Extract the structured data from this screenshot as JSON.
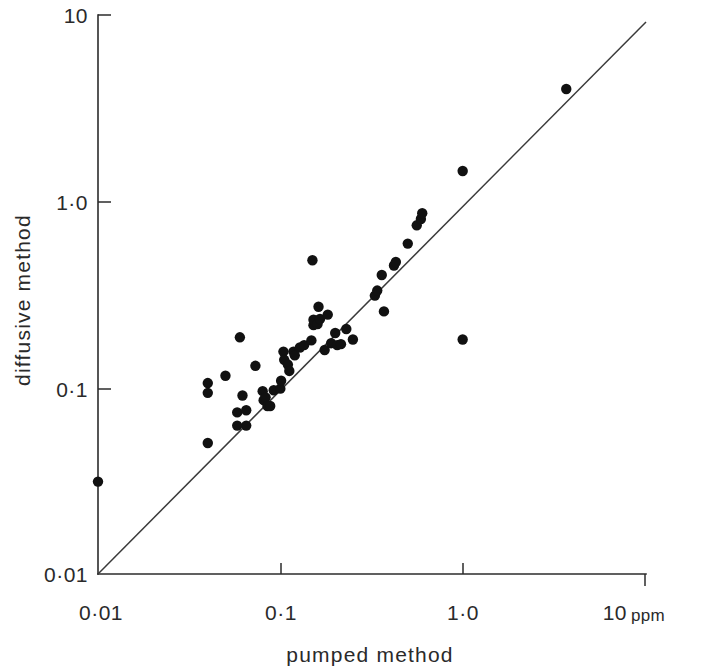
{
  "chart_data": {
    "type": "scatter",
    "title": "",
    "subtitle": "",
    "xlabel": "pumped method",
    "ylabel": "diffusive method",
    "unit_label": "ppm",
    "xscale": "log",
    "yscale": "log",
    "xlim": [
      0.01,
      10
    ],
    "ylim": [
      0.01,
      10
    ],
    "grid": false,
    "legend": null,
    "x_tick_labels": [
      "0·01",
      "0·1",
      "1·0",
      "10"
    ],
    "x_tick_values": [
      0.01,
      0.1,
      1,
      10
    ],
    "y_tick_labels": [
      "0·01",
      "0·1",
      "1·0",
      "10"
    ],
    "y_tick_values": [
      0.01,
      0.1,
      1,
      10
    ],
    "reference_line": {
      "name": "identity-line",
      "description": "1:1 line",
      "from": [
        0.01,
        0.01
      ],
      "to": [
        10,
        10
      ]
    },
    "series": [
      {
        "name": "paired measurements",
        "marker": "filled-circle",
        "color": "#111111",
        "points": [
          [
            0.01,
            0.031
          ],
          [
            0.04,
            0.105
          ],
          [
            0.04,
            0.093
          ],
          [
            0.04,
            0.05
          ],
          [
            0.05,
            0.115
          ],
          [
            0.058,
            0.073
          ],
          [
            0.058,
            0.062
          ],
          [
            0.06,
            0.185
          ],
          [
            0.062,
            0.09
          ],
          [
            0.065,
            0.075
          ],
          [
            0.065,
            0.062
          ],
          [
            0.073,
            0.13
          ],
          [
            0.08,
            0.095
          ],
          [
            0.081,
            0.085
          ],
          [
            0.083,
            0.088
          ],
          [
            0.085,
            0.079
          ],
          [
            0.088,
            0.079
          ],
          [
            0.092,
            0.096
          ],
          [
            0.1,
            0.098
          ],
          [
            0.101,
            0.108
          ],
          [
            0.104,
            0.155
          ],
          [
            0.105,
            0.14
          ],
          [
            0.11,
            0.132
          ],
          [
            0.112,
            0.122
          ],
          [
            0.118,
            0.155
          ],
          [
            0.12,
            0.148
          ],
          [
            0.128,
            0.163
          ],
          [
            0.135,
            0.168
          ],
          [
            0.148,
            0.178
          ],
          [
            0.15,
            0.48
          ],
          [
            0.152,
            0.215
          ],
          [
            0.152,
            0.23
          ],
          [
            0.16,
            0.218
          ],
          [
            0.162,
            0.27
          ],
          [
            0.165,
            0.232
          ],
          [
            0.175,
            0.158
          ],
          [
            0.182,
            0.245
          ],
          [
            0.19,
            0.172
          ],
          [
            0.2,
            0.195
          ],
          [
            0.205,
            0.168
          ],
          [
            0.215,
            0.17
          ],
          [
            0.23,
            0.205
          ],
          [
            0.25,
            0.18
          ],
          [
            0.33,
            0.31
          ],
          [
            0.34,
            0.33
          ],
          [
            0.36,
            0.4
          ],
          [
            0.37,
            0.255
          ],
          [
            0.42,
            0.45
          ],
          [
            0.43,
            0.47
          ],
          [
            0.5,
            0.59
          ],
          [
            0.56,
            0.74
          ],
          [
            0.59,
            0.8
          ],
          [
            0.6,
            0.86
          ],
          [
            1.0,
            0.18
          ],
          [
            1.0,
            1.45
          ],
          [
            3.7,
            4.0
          ]
        ]
      }
    ],
    "n_points": 56
  },
  "axes": {
    "y_axis_name": "diffusive-method-axis",
    "x_axis_name": "pumped-method-axis"
  }
}
